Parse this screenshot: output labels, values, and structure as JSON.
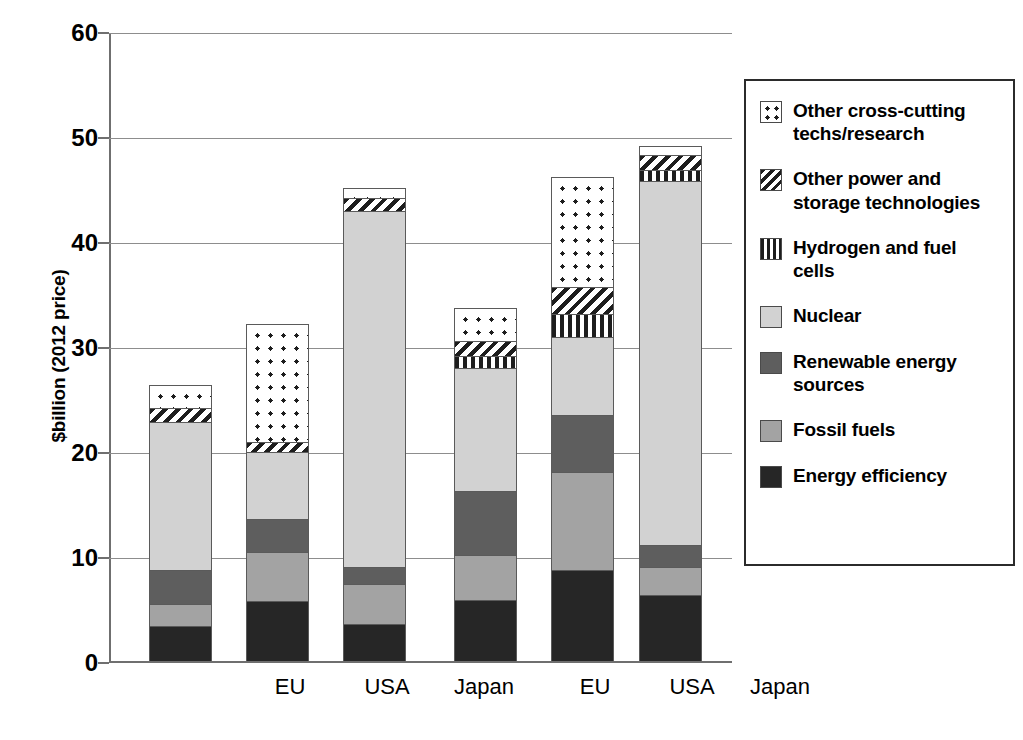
{
  "chart_data": {
    "type": "bar",
    "stacked": true,
    "title": "",
    "xlabel": "",
    "ylabel": "$billion (2012 price)",
    "ylim": [
      0,
      60
    ],
    "yticks": [
      0,
      10,
      20,
      30,
      40,
      50,
      60
    ],
    "ytick_labels": [
      "0",
      "10",
      "20",
      "30",
      "40",
      "50",
      "60"
    ],
    "grid": true,
    "legend_position": "right",
    "categories": [
      "EU",
      "USA",
      "Japan",
      "EU",
      "USA",
      "Japan"
    ],
    "groups": [
      {
        "period": "1991–2000",
        "categories": [
          "EU",
          "USA",
          "Japan"
        ]
      },
      {
        "period": "2001–10",
        "categories": [
          "EU",
          "USA",
          "Japan"
        ]
      }
    ],
    "series": [
      {
        "name": "Energy efficiency",
        "pattern": "solid-black",
        "values": [
          3.2,
          5.6,
          3.4,
          5.7,
          8.6,
          6.2
        ]
      },
      {
        "name": "Fossil fuels",
        "pattern": "solid-lightgray",
        "values": [
          2.1,
          4.7,
          3.8,
          4.3,
          9.3,
          2.7
        ]
      },
      {
        "name": "Renewable energy sources",
        "pattern": "solid-darkgray",
        "values": [
          3.3,
          3.1,
          1.7,
          6.1,
          5.4,
          2.1
        ]
      },
      {
        "name": "Nuclear",
        "pattern": "solid-palegray",
        "values": [
          14.1,
          6.4,
          33.9,
          11.7,
          7.5,
          34.6
        ]
      },
      {
        "name": "Hydrogen and fuel cells",
        "pattern": "vertical-stripes",
        "values": [
          0.0,
          0.0,
          0.0,
          1.2,
          2.2,
          1.1
        ]
      },
      {
        "name": "Other power and storage technologies",
        "pattern": "diagonal-hatch",
        "values": [
          1.3,
          1.0,
          1.2,
          1.4,
          2.5,
          1.4
        ]
      },
      {
        "name": "Other cross-cutting techs/research",
        "pattern": "dots",
        "values": [
          2.2,
          11.2,
          1.0,
          3.1,
          10.5,
          0.9
        ]
      }
    ],
    "totals": [
      26.2,
      32.0,
      45.0,
      33.5,
      46.0,
      49.0
    ]
  },
  "axis": {
    "y_title": "$billion (2012 price)",
    "y_tick_labels": [
      "60",
      "50",
      "40",
      "30",
      "20",
      "10",
      "0"
    ]
  },
  "x_axis": {
    "groups": [
      {
        "period_label": "1991–2000",
        "items": [
          "EU",
          "USA",
          "Japan"
        ]
      },
      {
        "period_label": "2001–10",
        "items": [
          "EU",
          "USA",
          "Japan"
        ]
      }
    ]
  },
  "legend": {
    "items": [
      {
        "label": "Other cross-cutting techs/research",
        "swatch": "other-cross",
        "icon_name": "dotted-pattern-swatch-icon"
      },
      {
        "label": "Other power and storage technologies",
        "swatch": "other-power",
        "icon_name": "diagonal-hatch-swatch-icon"
      },
      {
        "label": "Hydrogen and fuel cells",
        "swatch": "hydrogen",
        "icon_name": "vertical-stripe-swatch-icon"
      },
      {
        "label": "Nuclear",
        "swatch": "nuclear",
        "icon_name": "pale-gray-swatch-icon"
      },
      {
        "label": "Renewable energy sources",
        "swatch": "renewables",
        "icon_name": "dark-gray-swatch-icon"
      },
      {
        "label": "Fossil fuels",
        "swatch": "fossil-fuels",
        "icon_name": "light-gray-swatch-icon"
      },
      {
        "label": "Energy efficiency",
        "swatch": "energy-efficiency",
        "icon_name": "black-swatch-icon"
      }
    ]
  },
  "colors": {
    "energy_efficiency": "#262626",
    "fossil_fuels": "#a3a3a3",
    "renewables": "#5e5e5e",
    "nuclear": "#d2d2d2",
    "pattern_ink": "#1d1d1d",
    "gridline": "#8d8d8d",
    "axis": "#6f6f6f",
    "background": "#ffffff"
  }
}
